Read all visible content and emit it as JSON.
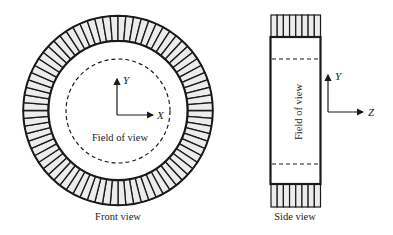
{
  "diagram": {
    "colors": {
      "stroke": "#1a1a1a",
      "detector_fill": "#ececec",
      "background": "#ffffff",
      "text": "#222222"
    },
    "front_view": {
      "caption": "Front view",
      "field_of_view_label": "Field of view",
      "axis_y_label": "Y",
      "axis_x_label": "X",
      "ring_segments": 76
    },
    "side_view": {
      "caption": "Side view",
      "field_of_view_label": "Field of view",
      "axis_y_label": "Y",
      "axis_z_label": "Z",
      "block_segments": 8
    }
  }
}
